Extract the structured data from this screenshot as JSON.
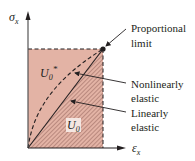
{
  "diagram": {
    "type": "stress-strain complementary energy diagram",
    "axes": {
      "y_label": "σ",
      "y_label_sub": "x",
      "x_label": "ε",
      "x_label_sub": "x"
    },
    "regions": {
      "complementary_energy": {
        "label": "U",
        "sub": "0",
        "sup": "*"
      },
      "strain_energy": {
        "label": "U",
        "sub": "0"
      }
    },
    "annotations": {
      "proportional_limit_line1": "Proportional",
      "proportional_limit_line2": "limit",
      "nonlinear_line1": "Nonlinearly",
      "nonlinear_line2": "elastic",
      "linear_line1": "Linearly",
      "linear_line2": "elastic"
    },
    "colors": {
      "fill": "#e3b3a5",
      "hatch": "#8f5f57",
      "line": "#231f20",
      "label_box": "#f4e6e1"
    }
  }
}
